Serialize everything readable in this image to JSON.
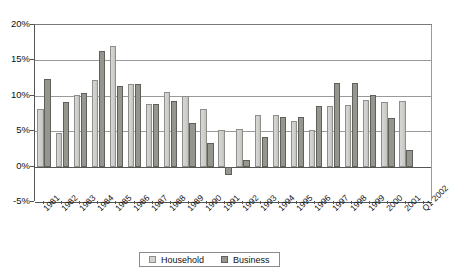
{
  "chart_data": {
    "type": "bar",
    "title": "",
    "subtitle": "",
    "xlabel": "",
    "ylabel": "",
    "ylim": [
      -5,
      20
    ],
    "grid": true,
    "grid_axis": "y",
    "legend_position": "bottom",
    "y_tick_labels": [
      "20%",
      "15%",
      "10%",
      "5%",
      "0%",
      "-5%"
    ],
    "y_ticks": [
      20,
      15,
      10,
      5,
      0,
      -5
    ],
    "categories": [
      "1981",
      "1982",
      "1983",
      "1984",
      "1985",
      "1986",
      "1987",
      "1988",
      "1989",
      "1990",
      "1991",
      "1992",
      "1993",
      "1994",
      "1995",
      "1996",
      "1997",
      "1998",
      "1999",
      "2000",
      "2001",
      "Q1 2002"
    ],
    "series": [
      {
        "name": "Household",
        "color": "#d2d2cf",
        "values": [
          8.1,
          4.8,
          10.1,
          12.3,
          17.0,
          11.6,
          8.8,
          10.6,
          10.0,
          8.2,
          5.2,
          5.3,
          7.3,
          7.3,
          6.4,
          5.2,
          8.5,
          8.7,
          9.4,
          9.1,
          9.3,
          null
        ]
      },
      {
        "name": "Business",
        "color": "#96968f",
        "values": [
          12.4,
          9.1,
          10.4,
          16.3,
          11.4,
          11.6,
          8.8,
          9.3,
          6.2,
          3.4,
          -1.2,
          0.9,
          4.2,
          7.0,
          7.0,
          8.6,
          11.8,
          11.8,
          10.1,
          6.8,
          2.4,
          null
        ]
      }
    ]
  },
  "legend": {
    "items": [
      {
        "label": "Household"
      },
      {
        "label": "Business"
      }
    ]
  }
}
